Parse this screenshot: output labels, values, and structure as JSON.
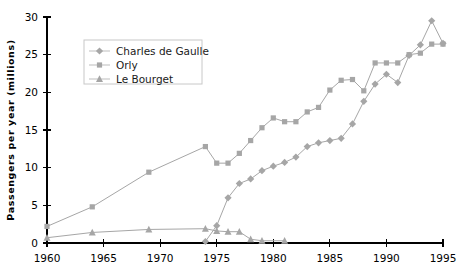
{
  "chart_data": {
    "type": "line",
    "title": "",
    "xlabel": "",
    "ylabel": "Passengers  per  year  (millions)",
    "xlim": [
      1960,
      1995
    ],
    "ylim": [
      0,
      30
    ],
    "xticks": [
      1960,
      1965,
      1970,
      1975,
      1980,
      1985,
      1990,
      1995
    ],
    "xtick_labels": [
      "1960",
      "1965",
      "1970",
      "1975",
      "1980",
      "1985",
      "1990",
      "1995"
    ],
    "yticks": [
      0,
      5,
      10,
      15,
      20,
      25,
      30
    ],
    "ytick_labels": [
      "0",
      "5",
      "10",
      "15",
      "20",
      "25",
      "30"
    ],
    "grid": false,
    "legend_position": "upper left",
    "series": [
      {
        "name": "Charles de Gaulle",
        "marker": "diamond",
        "color": "#a6a6a6",
        "x": [
          1974,
          1975,
          1976,
          1977,
          1978,
          1979,
          1980,
          1981,
          1982,
          1983,
          1984,
          1985,
          1986,
          1987,
          1988,
          1989,
          1990,
          1991,
          1992,
          1993,
          1994,
          1995
        ],
        "y": [
          0.2,
          2.3,
          6.0,
          7.9,
          8.5,
          9.6,
          10.2,
          10.7,
          11.4,
          12.8,
          13.3,
          13.6,
          13.9,
          15.8,
          18.8,
          21.1,
          22.4,
          21.3,
          24.9,
          26.3,
          29.5,
          26.5
        ]
      },
      {
        "name": "Orly",
        "marker": "square",
        "color": "#a6a6a6",
        "x": [
          1960,
          1964,
          1969,
          1974,
          1975,
          1976,
          1977,
          1978,
          1979,
          1980,
          1981,
          1982,
          1983,
          1984,
          1985,
          1986,
          1987,
          1988,
          1989,
          1990,
          1991,
          1992,
          1993,
          1994,
          1995
        ],
        "y": [
          2.2,
          4.8,
          9.4,
          12.8,
          10.6,
          10.6,
          11.9,
          13.6,
          15.3,
          16.6,
          16.1,
          16.1,
          17.4,
          18.0,
          20.3,
          21.6,
          21.7,
          20.2,
          23.9,
          23.9,
          23.9,
          25.0,
          25.2,
          26.4,
          26.4
        ]
      },
      {
        "name": "Le Bourget",
        "marker": "triangle",
        "color": "#a6a6a6",
        "x": [
          1960,
          1964,
          1969,
          1974,
          1975,
          1976,
          1977,
          1978,
          1979,
          1981
        ],
        "y": [
          0.7,
          1.4,
          1.8,
          1.9,
          1.6,
          1.5,
          1.5,
          0.5,
          0.3,
          0.3
        ]
      }
    ]
  },
  "legend": {
    "items": [
      {
        "label": "Charles de Gaulle",
        "marker": "diamond"
      },
      {
        "label": "Orly",
        "marker": "square"
      },
      {
        "label": "Le Bourget",
        "marker": "triangle"
      }
    ]
  },
  "colors": {
    "series": "#a6a6a6",
    "axis": "#000000",
    "background": "#ffffff",
    "legend_border": "#c8c8c8"
  }
}
